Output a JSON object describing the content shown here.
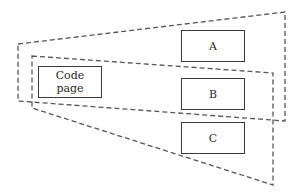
{
  "diagram": {
    "colors": {
      "line": "#555555",
      "box_border": "#3a3a3a",
      "text": "#2a2a2a",
      "background": "#ffffff"
    },
    "regions": [
      {
        "id": "outer-region",
        "style": "dashed",
        "points": [
          [
            18,
            44
          ],
          [
            285,
            12
          ],
          [
            285,
            121
          ],
          [
            18,
            101
          ]
        ]
      },
      {
        "id": "inner-region",
        "style": "dashed",
        "points": [
          [
            32,
            56
          ],
          [
            273,
            73
          ],
          [
            273,
            185
          ],
          [
            32,
            108
          ]
        ]
      }
    ],
    "boxes": [
      {
        "id": "code-page",
        "label": "Code\npage",
        "x": 38,
        "y": 66,
        "w": 64,
        "h": 32
      },
      {
        "id": "a",
        "label": "A",
        "x": 181,
        "y": 30,
        "w": 64,
        "h": 32
      },
      {
        "id": "b",
        "label": "B",
        "x": 181,
        "y": 78,
        "w": 64,
        "h": 32
      },
      {
        "id": "c",
        "label": "C",
        "x": 181,
        "y": 122,
        "w": 64,
        "h": 32
      }
    ]
  }
}
